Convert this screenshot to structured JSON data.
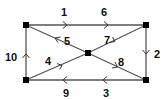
{
  "diagram": {
    "type": "directed-graph",
    "nodes": [
      {
        "id": "TL",
        "x": 26,
        "y": 25
      },
      {
        "id": "TR",
        "x": 146,
        "y": 25
      },
      {
        "id": "BR",
        "x": 146,
        "y": 80
      },
      {
        "id": "BL",
        "x": 26,
        "y": 80
      },
      {
        "id": "C",
        "x": 88,
        "y": 53
      }
    ],
    "edges": [
      {
        "label": "1",
        "from": "TL",
        "to": "TR",
        "label_pos": [
          64,
          15
        ]
      },
      {
        "label": "6",
        "from": "TL",
        "to": "TR",
        "label_pos": [
          104,
          15
        ]
      },
      {
        "label": "2",
        "from": "TR",
        "to": "BR",
        "label_pos": [
          158,
          57
        ]
      },
      {
        "label": "3",
        "from": "BR",
        "to": "BL",
        "label_pos": [
          106,
          97
        ]
      },
      {
        "label": "9",
        "from": "BR",
        "to": "BL",
        "label_pos": [
          66,
          97
        ]
      },
      {
        "label": "10",
        "from": "BL",
        "to": "TL",
        "label_pos": [
          9,
          61
        ]
      },
      {
        "label": "5",
        "from": "C",
        "to": "TL",
        "label_pos": [
          69,
          44
        ]
      },
      {
        "label": "7",
        "from": "TR",
        "to": "C",
        "label_pos": [
          108,
          43
        ]
      },
      {
        "label": "4",
        "from": "BL",
        "to": "C",
        "label_pos": [
          48,
          65
        ]
      },
      {
        "label": "8",
        "from": "C",
        "to": "BR",
        "label_pos": [
          122,
          65
        ]
      }
    ],
    "colors": {
      "edge": "#555555",
      "node": "#000000",
      "label": "#111111",
      "background": "#ffffff"
    }
  }
}
